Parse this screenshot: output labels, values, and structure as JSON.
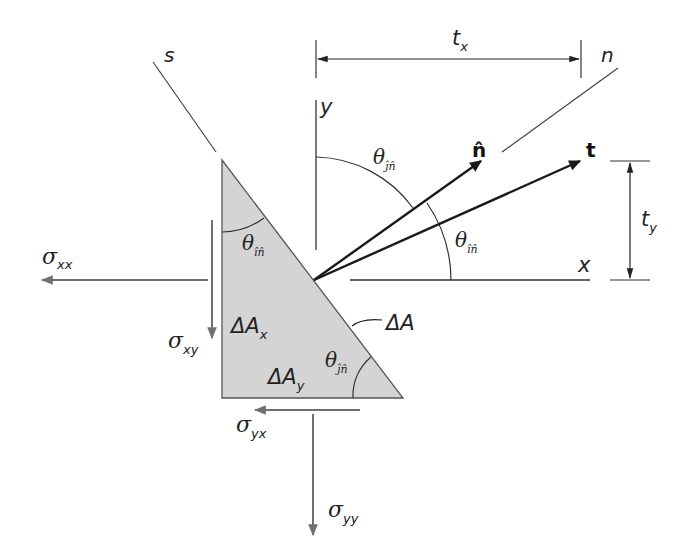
{
  "diagram": {
    "type": "stress-triangle-traction",
    "colors": {
      "triangle_fill": "#d4d4d4",
      "triangle_edge": "#555555",
      "stress_arrow": "#707070",
      "vector_arrow": "#1a1a1a",
      "line": "#333333",
      "background": "#ffffff"
    },
    "axes": {
      "y_label": "y",
      "x_label": "x",
      "s_label": "s",
      "n_label": "n"
    },
    "vectors": {
      "n_hat_label": "n̂",
      "t_label": "t"
    },
    "dimensions": {
      "tx_main": "t",
      "tx_sub": "x",
      "ty_main": "t",
      "ty_sub": "y"
    },
    "angles": {
      "theta_jn_top": {
        "main": "θ",
        "sub": "ĵn̂"
      },
      "theta_in_right": {
        "main": "θ",
        "sub": "în̂"
      },
      "theta_in_triangle": {
        "main": "θ",
        "sub": "în̂"
      },
      "theta_jn_triangle": {
        "main": "θ",
        "sub": "ĵn̂"
      }
    },
    "areas": {
      "dAx_main": "ΔA",
      "dAx_sub": "x",
      "dAy_main": "ΔA",
      "dAy_sub": "y",
      "dA": "ΔA"
    },
    "stresses": {
      "sxx_main": "σ",
      "sxx_sub": "xx",
      "sxy_main": "σ",
      "sxy_sub": "xy",
      "syx_main": "σ",
      "syx_sub": "yx",
      "syy_main": "σ",
      "syy_sub": "yy"
    }
  }
}
